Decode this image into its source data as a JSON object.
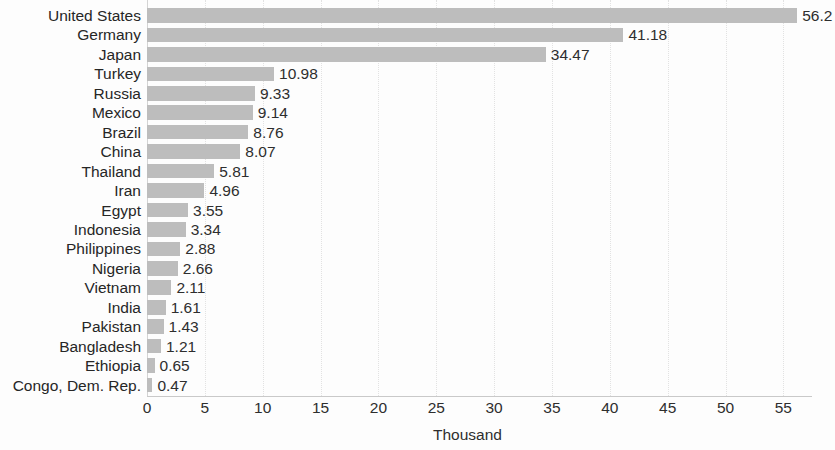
{
  "chart_data": {
    "type": "bar",
    "orientation": "horizontal",
    "title": "",
    "subtitle": "",
    "xlabel": "Thousand",
    "ylabel": "",
    "xlim": [
      0,
      57.5
    ],
    "grid": true,
    "legend": null,
    "xticks": [
      "0",
      "5",
      "10",
      "15",
      "20",
      "25",
      "30",
      "35",
      "40",
      "45",
      "50",
      "55"
    ],
    "xtick_values": [
      0,
      5,
      10,
      15,
      20,
      25,
      30,
      35,
      40,
      45,
      50,
      55
    ],
    "bar_color": "#bdbdbd",
    "categories": [
      "United States",
      "Germany",
      "Japan",
      "Turkey",
      "Russia",
      "Mexico",
      "Brazil",
      "China",
      "Thailand",
      "Iran",
      "Egypt",
      "Indonesia",
      "Philippines",
      "Nigeria",
      "Vietnam",
      "India",
      "Pakistan",
      "Bangladesh",
      "Ethiopia",
      "Congo, Dem. Rep."
    ],
    "values": [
      56.2,
      41.18,
      34.47,
      10.98,
      9.33,
      9.14,
      8.76,
      8.07,
      5.81,
      4.96,
      3.55,
      3.34,
      2.88,
      2.66,
      2.11,
      1.61,
      1.43,
      1.21,
      0.65,
      0.47
    ],
    "value_labels": [
      "56.2",
      "41.18",
      "34.47",
      "10.98",
      "9.33",
      "9.14",
      "8.76",
      "8.07",
      "5.81",
      "4.96",
      "3.55",
      "3.34",
      "2.88",
      "2.66",
      "2.11",
      "1.61",
      "1.43",
      "1.21",
      "0.65",
      "0.47"
    ]
  }
}
